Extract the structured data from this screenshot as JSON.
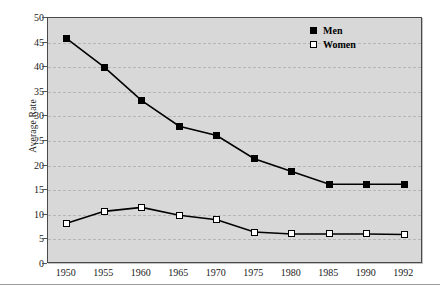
{
  "chart_data": {
    "type": "line",
    "title": "",
    "xlabel": "",
    "ylabel": "Average Rate",
    "categories": [
      "1950",
      "1955",
      "1960",
      "1965",
      "1970",
      "1975",
      "1980",
      "1985",
      "1990",
      "1992"
    ],
    "series": [
      {
        "name": "Men",
        "marker": "filled-square",
        "color": "#000000",
        "values": [
          45.8,
          40.0,
          33.2,
          28.0,
          26.1,
          21.4,
          18.8,
          16.2,
          16.2,
          16.2
        ]
      },
      {
        "name": "Women",
        "marker": "open-square",
        "color": "#000000",
        "values": [
          8.3,
          10.7,
          11.5,
          9.9,
          9.0,
          6.5,
          6.1,
          6.1,
          6.1,
          6.0
        ]
      }
    ],
    "ylim": [
      0,
      50
    ],
    "yticks": [
      0,
      5,
      10,
      15,
      20,
      25,
      30,
      35,
      40,
      45,
      50
    ],
    "grid": "horizontal-dashed",
    "legend_position": "top-right-inside",
    "plot_background": "#d8d8d8",
    "page_background": "#ffffff"
  }
}
